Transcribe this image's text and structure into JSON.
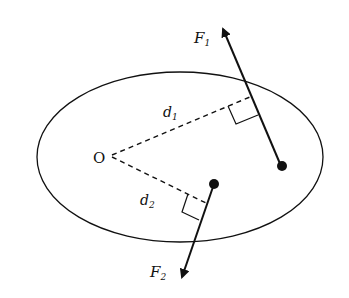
{
  "diagram": {
    "colors": {
      "stroke": "#111111",
      "background": "#ffffff"
    },
    "body": {
      "shape": "ellipse",
      "cx": 180,
      "cy": 157,
      "rx": 143,
      "ry": 85
    },
    "pivot": {
      "label": "O",
      "x": 110,
      "y": 156
    },
    "forces": [
      {
        "name": "F",
        "subscript": "1",
        "point": [
          281,
          166
        ],
        "tip": [
          222,
          26
        ],
        "foot": [
          250,
          97
        ]
      },
      {
        "name": "F",
        "subscript": "2",
        "point": [
          214,
          184
        ],
        "tip": [
          181,
          280
        ],
        "foot": [
          206,
          203
        ]
      }
    ],
    "lever_arms": [
      {
        "name": "d",
        "subscript": "1"
      },
      {
        "name": "d",
        "subscript": "2"
      }
    ]
  }
}
